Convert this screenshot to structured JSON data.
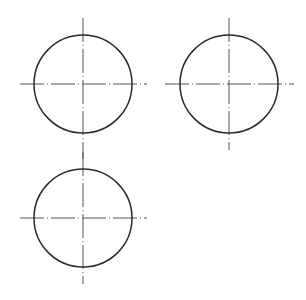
{
  "canvas": {
    "width": 306,
    "height": 300,
    "background": "#ffffff"
  },
  "colors": {
    "circle": "#2a2a2a",
    "centerline": "#555555"
  },
  "shapes": [
    {
      "id": "circle-1",
      "cx": 83,
      "cy": 84,
      "r": 49,
      "h_line": {
        "x1": 20,
        "x2": 147
      },
      "v_line": {
        "y1": 18,
        "y2": 159
      }
    },
    {
      "id": "circle-2",
      "cx": 229,
      "cy": 84,
      "r": 49,
      "h_line": {
        "x1": 165,
        "x2": 294
      },
      "v_line": {
        "y1": 18,
        "y2": 150
      }
    },
    {
      "id": "circle-3",
      "cx": 83,
      "cy": 218,
      "r": 49,
      "h_line": {
        "x1": 20,
        "x2": 147
      },
      "v_line": {
        "y1": 152,
        "y2": 284
      }
    }
  ]
}
